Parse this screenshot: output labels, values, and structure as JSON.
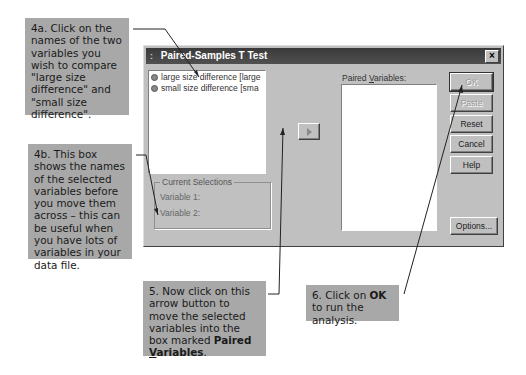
{
  "dialog": {
    "title": "Paired-Samples T Test",
    "system_menu_glyph": ":",
    "close_glyph": "×",
    "variables_list": [
      {
        "label": "large size difference [large"
      },
      {
        "label": "small size difference [sma"
      }
    ],
    "paired_variables_label_pre": "Paired ",
    "paired_variables_label_u": "V",
    "paired_variables_label_post": "ariables:",
    "current_selections": {
      "legend": "Current Selections",
      "variable1_label": "Variable 1:",
      "variable2_label": "Variable 2:"
    },
    "buttons": {
      "ok": "OK",
      "paste": "Paste",
      "reset": "Reset",
      "cancel": "Cancel",
      "help": "Help",
      "options": "Options..."
    }
  },
  "callouts": {
    "c4a": "4a. Click on the names of the two variables you wish to compare \"large size difference\" and \"small size difference\".",
    "c4b": "4b. This box shows the names of the selected variables before you move them across – this can be useful when you have lots of variables in your data file.",
    "c5_text": "5. Now click on this arrow button to move the selected variables into the box marked ",
    "c5_bold_pre": "Paired ",
    "c5_bold_u": "V",
    "c5_bold_post": "ariables",
    "c5_end": ".",
    "c6_pre": "6. Click on ",
    "c6_bold": "OK",
    "c6_post": " to run the analysis."
  },
  "colors": {
    "callout_bg": "#a8a8a8",
    "dialog_bg": "#c0c0c0",
    "titlebar_bg": "#404040"
  }
}
